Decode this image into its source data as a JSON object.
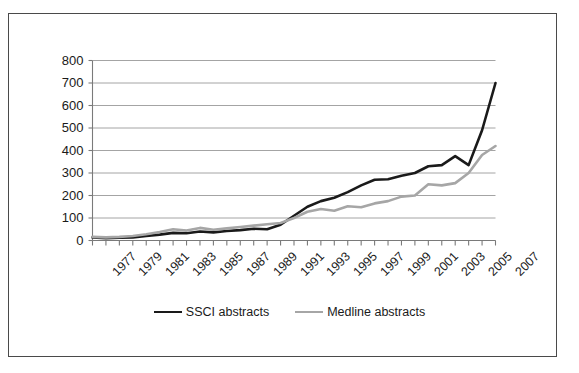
{
  "chart_data": {
    "type": "line",
    "title": "",
    "xlabel": "",
    "ylabel": "",
    "ylim": [
      0,
      800
    ],
    "ytick_step": 100,
    "yticks": [
      "0",
      "100",
      "200",
      "300",
      "400",
      "500",
      "600",
      "700",
      "800"
    ],
    "grid": true,
    "legend_position": "bottom",
    "x": [
      1977,
      1978,
      1979,
      1980,
      1981,
      1982,
      1983,
      1984,
      1985,
      1986,
      1987,
      1988,
      1989,
      1990,
      1991,
      1992,
      1993,
      1994,
      1995,
      1996,
      1997,
      1998,
      1999,
      2000,
      2001,
      2002,
      2003,
      2004,
      2005,
      2006,
      2007
    ],
    "xtick_labels": [
      "1977",
      "1979",
      "1981",
      "1983",
      "1985",
      "1987",
      "1989",
      "1991",
      "1993",
      "1995",
      "1997",
      "1999",
      "2001",
      "2003",
      "2005",
      "2007"
    ],
    "xlim": [
      1977,
      2007
    ],
    "series": [
      {
        "name": "SSCI abstracts",
        "color": "#1a1a1a",
        "width": 2.6,
        "values": [
          14,
          10,
          12,
          14,
          20,
          26,
          34,
          32,
          40,
          36,
          42,
          46,
          52,
          50,
          70,
          110,
          150,
          175,
          190,
          215,
          245,
          270,
          272,
          288,
          300,
          330,
          335,
          375,
          335,
          490,
          700
        ]
      },
      {
        "name": "Medline abstracts",
        "color": "#a6a6a6",
        "width": 2.6,
        "values": [
          16,
          14,
          16,
          20,
          28,
          38,
          50,
          44,
          56,
          48,
          54,
          60,
          66,
          72,
          78,
          100,
          128,
          140,
          132,
          152,
          148,
          165,
          175,
          195,
          200,
          250,
          245,
          255,
          300,
          380,
          420
        ]
      }
    ]
  },
  "legend": {
    "entries": [
      {
        "label": "SSCI abstracts",
        "color": "#1a1a1a"
      },
      {
        "label": "Medline abstracts",
        "color": "#a6a6a6"
      }
    ]
  }
}
